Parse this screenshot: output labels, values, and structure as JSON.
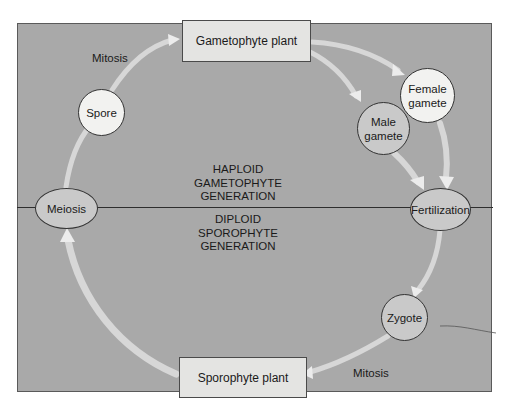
{
  "diagram": {
    "colors": {
      "panel": "#a9a9a9",
      "box_fill": "#e4e4e2",
      "light_node_fill": "#f2f2f0",
      "mid_node_fill": "#c9c9c9",
      "arrow": "#e8e8e8",
      "outline": "#333333"
    },
    "boxes": {
      "gametophyte": "Gametophyte plant",
      "sporophyte": "Sporophyte plant"
    },
    "nodes": {
      "spore": "Spore",
      "meiosis": "Meiosis",
      "male_gamete": [
        "Male",
        "gamete"
      ],
      "female_gamete": [
        "Female",
        "gamete"
      ],
      "fertilization": "Fertilization",
      "zygote": "Zygote"
    },
    "arrow_labels": {
      "mitosis_top": "Mitosis",
      "mitosis_bottom": "Mitosis"
    },
    "generations": {
      "haploid": [
        "HAPLOID",
        "GAMETOPHYTE",
        "GENERATION"
      ],
      "diploid": [
        "DIPLOID",
        "SPOROPHYTE",
        "GENERATION"
      ]
    }
  }
}
